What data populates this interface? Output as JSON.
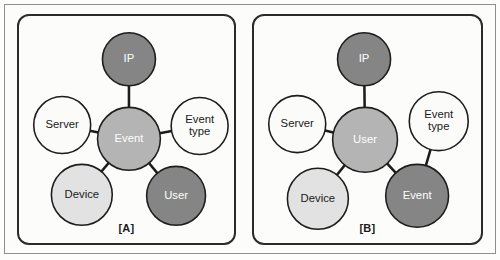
{
  "figure": {
    "width": 500,
    "height": 260,
    "background": "#fdfdfc",
    "frame_color": "#8e8e8e",
    "panel_border_color": "#2b2b2b"
  },
  "palette": {
    "node_white": "#fbfbfa",
    "node_light_gray": "#e2e2e2",
    "node_medium_gray": "#b4b4b4",
    "node_dark_gray": "#858585",
    "edge": "#1d1d1d",
    "text_dark": "#1a1a1a",
    "text_light": "#ffffff"
  },
  "panels": [
    {
      "id": "A",
      "caption": "[A]",
      "hub": "Event",
      "nodes": [
        {
          "id": "ip",
          "label": "IP",
          "lines": [
            "IP"
          ],
          "cx": 112,
          "cy": 44,
          "r": 27,
          "fill": "#858585",
          "text": "#ffffff"
        },
        {
          "id": "server",
          "label": "Server",
          "lines": [
            "Server"
          ],
          "cx": 44,
          "cy": 111,
          "r": 29,
          "fill": "#fbfbfa",
          "text": "#1a1a1a"
        },
        {
          "id": "event",
          "label": "Event",
          "lines": [
            "Event"
          ],
          "cx": 112,
          "cy": 125,
          "r": 32,
          "fill": "#b4b4b4",
          "text": "#ffffff"
        },
        {
          "id": "event-type",
          "label": "Event type",
          "lines": [
            "Event",
            "type"
          ],
          "cx": 184,
          "cy": 112,
          "r": 29,
          "fill": "#fbfbfa",
          "text": "#1a1a1a"
        },
        {
          "id": "device",
          "label": "Device",
          "lines": [
            "Device"
          ],
          "cx": 64,
          "cy": 182,
          "r": 31,
          "fill": "#e2e2e2",
          "text": "#1a1a1a"
        },
        {
          "id": "user",
          "label": "User",
          "lines": [
            "User"
          ],
          "cx": 160,
          "cy": 183,
          "r": 30,
          "fill": "#858585",
          "text": "#ffffff"
        }
      ],
      "edges": [
        {
          "from": "event",
          "to": "ip"
        },
        {
          "from": "event",
          "to": "server"
        },
        {
          "from": "event",
          "to": "event-type"
        },
        {
          "from": "event",
          "to": "device"
        },
        {
          "from": "event",
          "to": "user"
        }
      ]
    },
    {
      "id": "B",
      "caption": "[B]",
      "hub": "User",
      "nodes": [
        {
          "id": "ip",
          "label": "IP",
          "lines": [
            "IP"
          ],
          "cx": 112,
          "cy": 44,
          "r": 27,
          "fill": "#858585",
          "text": "#ffffff"
        },
        {
          "id": "server",
          "label": "Server",
          "lines": [
            "Server"
          ],
          "cx": 44,
          "cy": 110,
          "r": 29,
          "fill": "#fbfbfa",
          "text": "#1a1a1a"
        },
        {
          "id": "user",
          "label": "User",
          "lines": [
            "User"
          ],
          "cx": 113,
          "cy": 126,
          "r": 33,
          "fill": "#b4b4b4",
          "text": "#ffffff"
        },
        {
          "id": "event-type",
          "label": "Event type",
          "lines": [
            "Event",
            "type"
          ],
          "cx": 188,
          "cy": 107,
          "r": 30,
          "fill": "#fbfbfa",
          "text": "#1a1a1a"
        },
        {
          "id": "device",
          "label": "Device",
          "lines": [
            "Device"
          ],
          "cx": 65,
          "cy": 186,
          "r": 31,
          "fill": "#e2e2e2",
          "text": "#1a1a1a"
        },
        {
          "id": "event",
          "label": "Event",
          "lines": [
            "Event"
          ],
          "cx": 166,
          "cy": 183,
          "r": 32,
          "fill": "#858585",
          "text": "#ffffff"
        }
      ],
      "edges": [
        {
          "from": "user",
          "to": "ip"
        },
        {
          "from": "user",
          "to": "server"
        },
        {
          "from": "user",
          "to": "device"
        },
        {
          "from": "user",
          "to": "event"
        },
        {
          "from": "event",
          "to": "event-type"
        }
      ]
    }
  ]
}
